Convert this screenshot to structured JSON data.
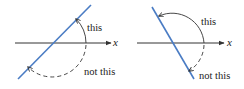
{
  "colors": {
    "line": "#4a7cc4",
    "axis": "#333333",
    "arc": "#333333",
    "text": "#222222"
  },
  "panels": [
    {
      "id": "left",
      "axis_label": "x",
      "solid_arc_label": "this",
      "dashed_arc_label": "not this",
      "line_direction": "positive-slope"
    },
    {
      "id": "right",
      "axis_label": "x",
      "solid_arc_label": "this",
      "dashed_arc_label": "not this",
      "line_direction": "negative-slope"
    }
  ]
}
